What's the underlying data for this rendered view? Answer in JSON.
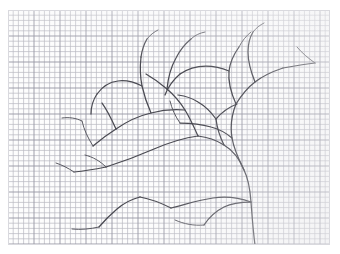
{
  "scene": {
    "title": "Pencil sketch of a bare tree on graph paper",
    "medium": "pencil-on-grid-paper",
    "background_color": "#ffffff",
    "paper_color": "#fdfdfd",
    "grid": {
      "minor_color": "#b9b9c2",
      "major_color": "#9a9aa6",
      "minor_spacing_px": 5.2,
      "major_every_n_cells": 5,
      "cols": 62,
      "rows": 45
    },
    "paper_bounds": {
      "x": 8,
      "y": 10,
      "width": 322,
      "height": 235
    },
    "stroke": {
      "color": "#4a4a52",
      "thin_color": "#5a5a62",
      "width": 1.25,
      "thin_width": 1.0
    },
    "subject": "bare-tree",
    "branch_count": 28
  },
  "drawing": {
    "viewbox": "0 0 322 235",
    "paths": [
      "M 247 235 C 245 220, 244 205, 243 192 C 242 178, 240 168, 236 160 C 231 150, 226 140, 224 128 C 222 116, 224 104, 228 94",
      "M 243 192 C 232 188, 218 186, 205 188 C 190 190, 176 195, 163 198",
      "M 243 192 C 235 192, 224 193, 216 197 C 206 202, 200 209, 196 215",
      "M 236 160 C 232 150, 226 141, 216 135 C 208 130, 199 127, 190 126",
      "M 190 126 C 175 128, 160 133, 146 139 C 130 146, 114 152, 98 157",
      "M 98 157 C 88 159, 76 161, 66 162",
      "M 190 126 C 186 117, 182 108, 177 100 C 172 92, 166 85, 159 79",
      "M 159 79 C 152 73, 145 68, 138 64",
      "M 177 100 C 166 99, 154 100, 143 103 C 130 106, 118 112, 108 119",
      "M 108 119 C 100 124, 92 130, 85 136",
      "M 224 128 C 218 123, 211 119, 203 117 C 193 114, 182 113, 172 113",
      "M 228 94 C 233 86, 239 78, 247 72 C 256 65, 266 61, 275 58",
      "M 275 58 C 286 56, 297 54, 307 53",
      "M 228 94 C 223 83, 220 72, 221 61 C 222 52, 226 44, 231 37",
      "M 221 61 C 214 58, 206 56, 198 56 C 188 56, 179 59, 172 64",
      "M 172 64 C 165 70, 160 77, 157 85",
      "M 247 72 C 243 62, 240 52, 240 42 C 240 34, 242 27, 245 22",
      "M 143 103 C 139 94, 136 85, 134 76 C 132 66, 132 56, 133 47",
      "M 133 47 C 134 40, 136 34, 139 29",
      "M 134 76 C 126 72, 118 70, 110 71 C 101 72, 94 77, 89 84",
      "M 89 84 C 85 90, 83 97, 83 104",
      "M 108 119 C 104 110, 100 101, 94 93",
      "M 159 79 C 160 68, 163 57, 168 48 C 172 40, 177 34, 183 29",
      "M 216 135 C 212 127, 209 118, 208 109",
      "M 208 109 C 203 102, 197 96, 190 92 C 184 88, 177 86, 170 85",
      "M 208 109 C 214 102, 221 97, 229 94",
      "M 163 198 C 153 193, 143 189, 132 187",
      "M 132 187 C 124 189, 116 193, 109 199 C 102 205, 96 211, 91 217"
    ],
    "thin_paths": [
      "M 98 157 C 92 151, 85 147, 77 145",
      "M 66 162 C 60 158, 54 155, 48 153",
      "M 85 136 C 80 128, 76 120, 74 111",
      "M 74 111 C 68 108, 61 107, 54 108",
      "M 172 113 C 167 106, 164 99, 162 91",
      "M 307 53 C 300 48, 294 43, 289 37",
      "M 196 215 C 186 216, 176 214, 167 210",
      "M 91 217 C 82 219, 73 220, 64 219",
      "M 245 22 C 248 18, 252 15, 256 13",
      "M 231 37 C 234 31, 238 26, 243 22",
      "M 139 29 C 142 25, 146 22, 150 20",
      "M 183 29 C 187 25, 192 23, 197 22"
    ]
  }
}
